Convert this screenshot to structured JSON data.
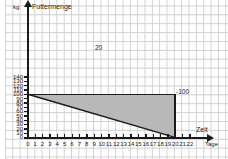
{
  "chart_data": {
    "type": "area",
    "title": "Futtermenge",
    "xlabel": "Zeit",
    "xunit": "Tage",
    "ylabel": "Futtermenge",
    "yunit": "kg",
    "xlim": [
      0,
      22
    ],
    "ylim": [
      0,
      145
    ],
    "grid": true,
    "legend": "none",
    "x_ticks": [
      0,
      1,
      2,
      3,
      4,
      5,
      6,
      7,
      8,
      9,
      10,
      11,
      12,
      13,
      14,
      15,
      16,
      17,
      18,
      19,
      20,
      21,
      22
    ],
    "y_ticks": [
      0,
      10,
      20,
      30,
      40,
      50,
      60,
      70,
      80,
      90,
      100,
      110,
      120,
      130,
      140
    ],
    "series": [
      {
        "name": "Futtermenge",
        "x": [
          0,
          20
        ],
        "values": [
          100,
          0
        ],
        "description": "Fallende Gerade von (0 Tage, 100 kg) bis (20 Tage, 0 kg)"
      }
    ],
    "shaded_region": {
      "type": "triangle",
      "vertices": [
        [
          0,
          100
        ],
        [
          20,
          100
        ],
        [
          20,
          0
        ]
      ],
      "fill": "#b8b8b8"
    },
    "annotations": [
      {
        "text": "20",
        "x": 10,
        "y": 100,
        "role": "horizontal-leg-label"
      },
      {
        "text": "-100",
        "x": 20.5,
        "y": 50,
        "role": "vertical-leg-label"
      }
    ]
  },
  "axes": {
    "y_axis_unit_label": "kg",
    "y_axis_name": "Futtermenge",
    "x_axis_name": "Zeit",
    "x_axis_unit_label": "Tage"
  },
  "colors": {
    "line": "#1a1a1a",
    "fill": "#b8b8b8",
    "grid": "#cfcfcf",
    "background": "#ffffff"
  }
}
